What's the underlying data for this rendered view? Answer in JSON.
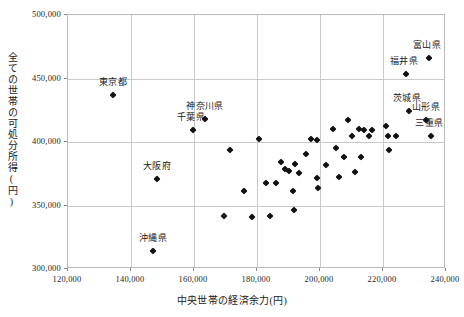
{
  "chart_data": {
    "type": "scatter",
    "title": "",
    "xlabel": "中央世帯の経済余力(円)",
    "ylabel": "全ての世帯の可処分所得(円)",
    "xlim": [
      120000,
      240000
    ],
    "ylim": [
      300000,
      500000
    ],
    "xticks": [
      "120,000",
      "140,000",
      "160,000",
      "180,000",
      "200,000",
      "220,000",
      "240,000"
    ],
    "xtick_values": [
      120000,
      140000,
      160000,
      180000,
      200000,
      220000,
      240000
    ],
    "yticks": [
      "300,000",
      "350,000",
      "400,000",
      "450,000",
      "500,000"
    ],
    "ytick_values": [
      300000,
      350000,
      400000,
      450000,
      500000
    ],
    "grid": true,
    "legend": false,
    "marker": "diamond",
    "marker_color": "#111111",
    "points": [
      {
        "label": "東京都",
        "x": 134300,
        "y": 437000,
        "label_dx": 0,
        "label_dy": -7
      },
      {
        "label": "神奈川県",
        "x": 163500,
        "y": 418000,
        "label_dx": 0,
        "label_dy": -7
      },
      {
        "label": "千葉県",
        "x": 159700,
        "y": 409500,
        "label_dx": -2,
        "label_dy": -7
      },
      {
        "label": "大阪府",
        "x": 148300,
        "y": 370500,
        "label_dx": 0,
        "label_dy": -7
      },
      {
        "label": "沖縄県",
        "x": 147000,
        "y": 314500,
        "label_dx": 0,
        "label_dy": -7
      },
      {
        "label": "富山県",
        "x": 234600,
        "y": 466000,
        "label_dx": -2,
        "label_dy": -7
      },
      {
        "label": "福井県",
        "x": 227300,
        "y": 453500,
        "label_dx": -2,
        "label_dy": -7
      },
      {
        "label": "茨城県",
        "x": 228300,
        "y": 424500,
        "label_dx": -2,
        "label_dy": -7
      },
      {
        "label": "山形県",
        "x": 233700,
        "y": 417500,
        "label_dx": 0,
        "label_dy": -7
      },
      {
        "label": "三重県",
        "x": 235300,
        "y": 404500,
        "label_dx": -2,
        "label_dy": -7
      },
      {
        "label": "",
        "x": 171300,
        "y": 394000
      },
      {
        "label": "",
        "x": 180500,
        "y": 402000
      },
      {
        "label": "",
        "x": 187500,
        "y": 384000
      },
      {
        "label": "",
        "x": 189000,
        "y": 379000
      },
      {
        "label": "",
        "x": 190300,
        "y": 377000
      },
      {
        "label": "",
        "x": 192000,
        "y": 382500
      },
      {
        "label": "",
        "x": 193300,
        "y": 375500
      },
      {
        "label": "",
        "x": 195500,
        "y": 390500
      },
      {
        "label": "",
        "x": 197000,
        "y": 402500
      },
      {
        "label": "",
        "x": 199000,
        "y": 401500
      },
      {
        "label": "",
        "x": 186000,
        "y": 367500
      },
      {
        "label": "",
        "x": 191300,
        "y": 361500
      },
      {
        "label": "",
        "x": 191800,
        "y": 346500
      },
      {
        "label": "",
        "x": 199000,
        "y": 371500
      },
      {
        "label": "",
        "x": 199300,
        "y": 363500
      },
      {
        "label": "",
        "x": 204000,
        "y": 410500
      },
      {
        "label": "",
        "x": 205000,
        "y": 395000
      },
      {
        "label": "",
        "x": 206000,
        "y": 372500
      },
      {
        "label": "",
        "x": 209000,
        "y": 417000
      },
      {
        "label": "",
        "x": 210000,
        "y": 404500
      },
      {
        "label": "",
        "x": 211000,
        "y": 376500
      },
      {
        "label": "",
        "x": 212500,
        "y": 410000
      },
      {
        "label": "",
        "x": 214000,
        "y": 409500
      },
      {
        "label": "",
        "x": 215500,
        "y": 404500
      },
      {
        "label": "",
        "x": 216500,
        "y": 409500
      },
      {
        "label": "",
        "x": 213000,
        "y": 388500
      },
      {
        "label": "",
        "x": 221000,
        "y": 412500
      },
      {
        "label": "",
        "x": 221500,
        "y": 404500
      },
      {
        "label": "",
        "x": 224000,
        "y": 404500
      },
      {
        "label": "",
        "x": 222000,
        "y": 394000
      },
      {
        "label": "",
        "x": 184000,
        "y": 341500
      },
      {
        "label": "",
        "x": 178500,
        "y": 341000
      },
      {
        "label": "",
        "x": 176000,
        "y": 361500
      },
      {
        "label": "",
        "x": 169500,
        "y": 341500
      },
      {
        "label": "",
        "x": 183000,
        "y": 367500
      },
      {
        "label": "",
        "x": 202000,
        "y": 381500
      },
      {
        "label": "",
        "x": 207500,
        "y": 388000
      }
    ]
  }
}
